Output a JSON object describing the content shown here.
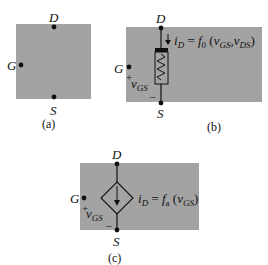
{
  "figure": {
    "colors": {
      "panel": "#a3a3a3",
      "ink": "#111111",
      "background": "#ffffff"
    },
    "panels": [
      {
        "id": "a",
        "caption": "(a)",
        "terminals": {
          "drain": "D",
          "gate": "G",
          "source": "S"
        }
      },
      {
        "id": "b",
        "caption": "(b)",
        "terminals": {
          "drain": "D",
          "gate": "G",
          "source": "S"
        },
        "element": "variable-resistor",
        "equation": {
          "lhs": "i",
          "lhs_sub": "D",
          "eq": "=",
          "fn": "f",
          "fn_sub": "0",
          "open": "(",
          "arg1": "v",
          "arg1_sub": "GS",
          "sep": ",",
          "arg2": "v",
          "arg2_sub": "DS",
          "close": ")"
        },
        "voltage": {
          "plus": "+",
          "minus": "–",
          "label": "v",
          "label_sub": "GS"
        }
      },
      {
        "id": "c",
        "caption": "(c)",
        "terminals": {
          "drain": "D",
          "gate": "G",
          "source": "S"
        },
        "element": "dependent-current-source",
        "equation": {
          "lhs": "i",
          "lhs_sub": "D",
          "eq": "=",
          "fn": "f",
          "fn_sub": "a",
          "open": "(",
          "arg1": "v",
          "arg1_sub": "GS",
          "close": ")"
        },
        "voltage": {
          "plus": "+",
          "minus": "–",
          "label": "v",
          "label_sub": "GS"
        }
      }
    ]
  }
}
